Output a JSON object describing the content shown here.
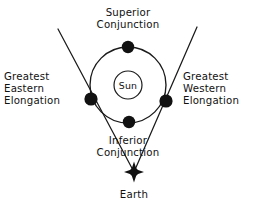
{
  "diagram": {
    "background_color": "#ffffff",
    "ink_color": "#111111",
    "labels": {
      "superior_conjunction_line1": "Superior",
      "superior_conjunction_line2": "Conjunction",
      "inferior_conjunction_line1": "Inferior",
      "inferior_conjunction_line2": "Conjunction",
      "greatest_eastern_line1": "Greatest",
      "greatest_eastern_line2": "Eastern",
      "greatest_eastern_line3": "Elongation",
      "greatest_western_line1": "Greatest",
      "greatest_western_line2": "Western",
      "greatest_western_line3": "Elongation",
      "sun": "Sun",
      "earth": "Earth"
    },
    "bodies": [
      {
        "name": "sun",
        "label": "Sun",
        "shape": "open-circle",
        "cx": 128,
        "cy": 85,
        "r": 14
      },
      {
        "name": "planet-superior-conjunction",
        "label": "Superior Conjunction",
        "shape": "filled-dot",
        "cx": 128,
        "cy": 47,
        "r": 6.2
      },
      {
        "name": "planet-greatest-eastern-elongation",
        "label": "Greatest Eastern Elongation",
        "shape": "filled-dot",
        "cx": 91,
        "cy": 99,
        "r": 6.6
      },
      {
        "name": "planet-greatest-western-elongation",
        "label": "Greatest Western Elongation",
        "shape": "filled-dot",
        "cx": 166,
        "cy": 101,
        "r": 6.6
      },
      {
        "name": "planet-inferior-conjunction",
        "label": "Inferior Conjunction",
        "shape": "filled-dot",
        "cx": 129,
        "cy": 122,
        "r": 6.2
      },
      {
        "name": "earth",
        "label": "Earth",
        "shape": "four-point-star",
        "cx": 134,
        "cy": 172,
        "r": 9.5
      }
    ],
    "orbit": {
      "name": "planet-orbit",
      "cx": 128,
      "cy": 85,
      "rx": 38,
      "ry": 38
    },
    "sight_lines": [
      {
        "name": "sight-line-eastern",
        "from_x": 58,
        "from_y": 29,
        "to_x": 134,
        "to_y": 172
      },
      {
        "name": "sight-line-western",
        "from_x": 197,
        "from_y": 27,
        "to_x": 134,
        "to_y": 172
      }
    ]
  }
}
